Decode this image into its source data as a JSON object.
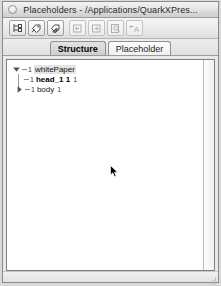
{
  "window": {
    "title": "Placeholders - /Applications/QuarkXPres...",
    "close_button": "close-button"
  },
  "toolbar": {
    "buttons": [
      {
        "name": "new-node-button",
        "icon": "tree-node-icon",
        "enabled": true,
        "label": "New Node"
      },
      {
        "name": "new-placeholder-button",
        "icon": "tag-plus-icon",
        "enabled": true,
        "label": "New Placeholder"
      },
      {
        "name": "edit-placeholder-button",
        "icon": "tag-edit-icon",
        "enabled": true,
        "label": "Edit Placeholder"
      },
      {
        "name": "import-button",
        "icon": "arrow-into-box-icon",
        "enabled": false,
        "label": "Import"
      },
      {
        "name": "export-button",
        "icon": "arrow-outof-box-icon",
        "enabled": false,
        "label": "Export"
      },
      {
        "name": "find-button",
        "icon": "magnifier-page-icon",
        "enabled": false,
        "label": "Find"
      },
      {
        "name": "text-attributes-button",
        "icon": "text-a-icon",
        "enabled": false,
        "label": "Text Attributes"
      }
    ]
  },
  "tabs": {
    "items": [
      {
        "label": "Structure",
        "name": "tab-structure",
        "active": true
      },
      {
        "label": "Placeholder",
        "name": "tab-placeholder",
        "active": false
      }
    ]
  },
  "tree": {
    "rows": [
      {
        "name": "tree-item-whitepaper",
        "level": 0,
        "twisty": "expanded",
        "count": "1",
        "label": "whitePaper",
        "bold": false,
        "selected": true,
        "tail": ""
      },
      {
        "name": "tree-item-head",
        "level": 1,
        "twisty": "none",
        "count": "1",
        "label": "head_1 1",
        "bold": true,
        "selected": false,
        "tail": "1"
      },
      {
        "name": "tree-item-body",
        "level": 1,
        "twisty": "collapsed",
        "count": "1",
        "label": "body",
        "bold": false,
        "selected": false,
        "tail": "1"
      }
    ]
  },
  "cursor": {
    "name": "mouse-pointer",
    "x": 103,
    "y": 104
  },
  "colors": {
    "window_bg": "#e8e8e8",
    "content_bg": "#ffffff",
    "border": "#7e7e7e",
    "text": "#1a1a1a",
    "active_tab": "#d6d6d6"
  }
}
